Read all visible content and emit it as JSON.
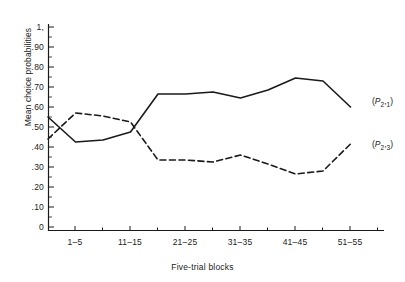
{
  "chart_data": {
    "type": "line",
    "title": "",
    "xlabel": "Five-trial blocks",
    "ylabel": "Mean choice probabilities",
    "xlim": [
      0,
      12
    ],
    "ylim": [
      0,
      1.0
    ],
    "grid": false,
    "legend_position": "right-of-line-ends",
    "y_ticklabels": [
      "1,",
      ".90",
      ".80",
      ".70",
      ".60",
      ".50",
      ".40",
      ".30",
      ".20",
      ".10",
      "0"
    ],
    "y_tickvalues": [
      1.0,
      0.9,
      0.8,
      0.7,
      0.6,
      0.5,
      0.4,
      0.3,
      0.2,
      0.1,
      0
    ],
    "x_ticklabels": [
      "1–5",
      "11–15",
      "21–25",
      "31–35",
      "41–45",
      "51–55"
    ],
    "x_tickvalues": [
      1,
      3,
      5,
      7,
      9,
      11
    ],
    "categories": [
      1,
      2,
      3,
      4,
      5,
      6,
      7,
      8,
      9,
      10,
      11,
      12
    ],
    "series": [
      {
        "name": "(P2,1)",
        "label_main": "P",
        "label_sub1": "2",
        "label_sub2": "1",
        "style": "solid",
        "color": "#1a1a1a",
        "values": [
          0.55,
          0.425,
          0.435,
          0.475,
          0.665,
          0.665,
          0.675,
          0.645,
          0.685,
          0.745,
          0.73,
          0.6
        ]
      },
      {
        "name": "(P2,3)",
        "label_main": "P",
        "label_sub1": "2",
        "label_sub2": "3",
        "style": "dashed",
        "color": "#1a1a1a",
        "values": [
          0.44,
          0.57,
          0.555,
          0.525,
          0.335,
          0.335,
          0.325,
          0.36,
          0.315,
          0.265,
          0.28,
          0.415
        ]
      }
    ]
  },
  "axes": {
    "y_axis_name": "mean-choice-probabilities-axis",
    "x_axis_name": "five-trial-blocks-axis"
  }
}
